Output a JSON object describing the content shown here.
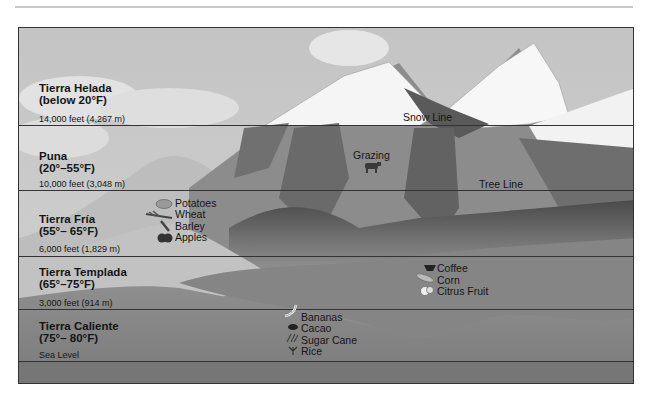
{
  "zones": [
    {
      "name": "Tierra Helada",
      "temp": "(below 20°F)",
      "elevation": "14,000 feet (4,267 m)"
    },
    {
      "name": "Puna",
      "temp": "(20°–55°F)",
      "elevation": "10,000 feet (3,048 m)"
    },
    {
      "name": "Tierra Fría",
      "temp": "(55°– 65°F)",
      "elevation": "6,000 feet (1,829 m)"
    },
    {
      "name": "Tierra Templada",
      "temp": "(65°–75°F)",
      "elevation": "3,000 feet (914 m)"
    },
    {
      "name": "Tierra Caliente",
      "temp": "(75°– 80°F)",
      "elevation": "Sea Level"
    }
  ],
  "boundaries": {
    "snow_line": "Snow Line",
    "tree_line": "Tree Line"
  },
  "activities": {
    "puna": [
      {
        "label": "Grazing",
        "icon": "cow-icon"
      }
    ],
    "tierra_fria": [
      {
        "label": "Potatoes",
        "icon": "potato-icon"
      },
      {
        "label": "Wheat",
        "icon": "wheat-icon"
      },
      {
        "label": "Barley",
        "icon": "barley-icon"
      },
      {
        "label": "Apples",
        "icon": "apples-icon"
      }
    ],
    "tierra_templada": [
      {
        "label": "Coffee",
        "icon": "coffee-icon"
      },
      {
        "label": "Corn",
        "icon": "corn-icon"
      },
      {
        "label": "Citrus Fruit",
        "icon": "citrus-icon"
      }
    ],
    "tierra_caliente": [
      {
        "label": "Bananas",
        "icon": "bananas-icon"
      },
      {
        "label": "Cacao",
        "icon": "cacao-icon"
      },
      {
        "label": "Sugar Cane",
        "icon": "sugar-cane-icon"
      },
      {
        "label": "Rice",
        "icon": "rice-icon"
      }
    ]
  },
  "colors": {
    "sky": "#cfcfcf",
    "snow": "#f6f6f6",
    "rock_dark": "#6a6a6a",
    "rock_mid": "#8c8c8c",
    "lowland": "#8a8a8a",
    "line": "#333333"
  }
}
